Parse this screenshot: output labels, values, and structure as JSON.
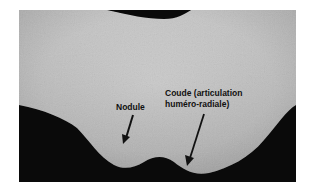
{
  "figure": {
    "background_color": "#ffffff",
    "skin_color": "#c9c9c9",
    "dark_background_color": "#0a0a0a"
  },
  "annotations": [
    {
      "id": "nodule",
      "text": "Nodule"
    },
    {
      "id": "coude",
      "line1": "Coude (articulation",
      "line2": "huméro-radiale)"
    }
  ]
}
